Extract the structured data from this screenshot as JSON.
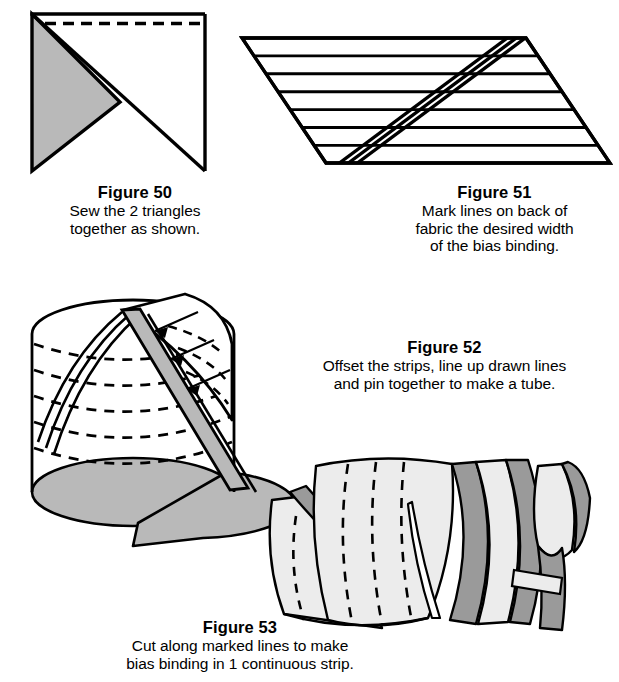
{
  "page": {
    "background_color": "#ffffff",
    "ink_color": "#000000",
    "fill_light_gray": "#b9b9b9",
    "fill_mid_gray": "#9a9a9a",
    "fill_pale_gray": "#ececec"
  },
  "figures": [
    {
      "id": "figure-50",
      "number": "Figure 50",
      "caption_lines": [
        "Sew the 2 triangles",
        "together as shown."
      ],
      "illustration": "square-of-fabric-folded-into-two-triangles-with-dashed-stitch-line-across-top"
    },
    {
      "id": "figure-51",
      "number": "Figure 51",
      "caption_lines": [
        "Mark lines on back of",
        "fabric the desired width",
        "of the bias binding."
      ],
      "illustration": "parallelogram-of-bias-fabric-with-seven-horizontal-marked-lines-and-a-diagonal-triple-line-seam"
    },
    {
      "id": "figure-52",
      "number": "Figure 52",
      "caption_lines": [
        "Offset the strips, line up drawn lines",
        "and pin together to make a tube."
      ],
      "illustration": "fabric-tube-cylinder-with-dashed-marked-lines-gray-diagonal-seam-and-three-arrows-pointing-to-seam"
    },
    {
      "id": "figure-53",
      "number": "Figure 53",
      "caption_lines": [
        "Cut along marked lines to make",
        "bias binding in 1 continuous strip."
      ],
      "illustration": "tube-being-cut-in-a-spiral-into-one-long-continuous-bias-strip"
    }
  ]
}
